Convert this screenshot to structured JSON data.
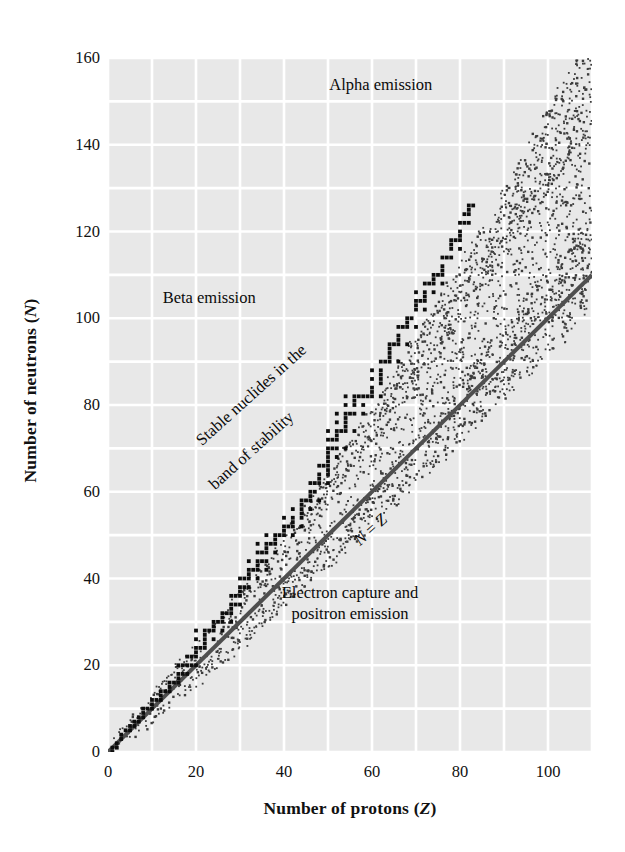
{
  "chart_data": {
    "type": "scatter",
    "title": "",
    "xlabel": "Number of protons (Z)",
    "ylabel": "Number of neutrons (N)",
    "xlim": [
      0,
      110
    ],
    "ylim": [
      0,
      160
    ],
    "grid": true,
    "grid_step_x": 10,
    "grid_step_y": 10,
    "xticks": [
      0,
      20,
      40,
      60,
      80,
      100
    ],
    "yticks": [
      0,
      20,
      40,
      60,
      80,
      100,
      120,
      140,
      160
    ],
    "legend": "none",
    "series": [
      {
        "name": "Stable nuclides (band of stability)",
        "marker": "filled-square",
        "color": "#0d0d0d",
        "description": "Dark band of stable nuclide points rising from (1,1) to about (83,126); N equals Z at low Z and curves to N/Z of about 1.5 at high Z.",
        "points": [
          [
            1,
            0
          ],
          [
            1,
            1
          ],
          [
            2,
            1
          ],
          [
            2,
            2
          ],
          [
            3,
            3
          ],
          [
            3,
            4
          ],
          [
            4,
            5
          ],
          [
            5,
            5
          ],
          [
            5,
            6
          ],
          [
            6,
            6
          ],
          [
            6,
            7
          ],
          [
            7,
            7
          ],
          [
            7,
            8
          ],
          [
            8,
            8
          ],
          [
            8,
            9
          ],
          [
            8,
            10
          ],
          [
            9,
            10
          ],
          [
            10,
            10
          ],
          [
            10,
            11
          ],
          [
            10,
            12
          ],
          [
            11,
            12
          ],
          [
            12,
            12
          ],
          [
            12,
            13
          ],
          [
            12,
            14
          ],
          [
            13,
            14
          ],
          [
            14,
            14
          ],
          [
            14,
            15
          ],
          [
            14,
            16
          ],
          [
            15,
            16
          ],
          [
            16,
            16
          ],
          [
            16,
            17
          ],
          [
            16,
            18
          ],
          [
            16,
            20
          ],
          [
            17,
            18
          ],
          [
            17,
            20
          ],
          [
            18,
            18
          ],
          [
            18,
            20
          ],
          [
            18,
            22
          ],
          [
            19,
            20
          ],
          [
            19,
            22
          ],
          [
            20,
            20
          ],
          [
            20,
            22
          ],
          [
            20,
            23
          ],
          [
            20,
            24
          ],
          [
            20,
            26
          ],
          [
            20,
            28
          ],
          [
            21,
            24
          ],
          [
            22,
            24
          ],
          [
            22,
            25
          ],
          [
            22,
            26
          ],
          [
            22,
            27
          ],
          [
            22,
            28
          ],
          [
            23,
            28
          ],
          [
            24,
            26
          ],
          [
            24,
            28
          ],
          [
            24,
            29
          ],
          [
            24,
            30
          ],
          [
            25,
            30
          ],
          [
            26,
            28
          ],
          [
            26,
            30
          ],
          [
            26,
            31
          ],
          [
            26,
            32
          ],
          [
            27,
            32
          ],
          [
            28,
            30
          ],
          [
            28,
            32
          ],
          [
            28,
            33
          ],
          [
            28,
            34
          ],
          [
            28,
            36
          ],
          [
            29,
            34
          ],
          [
            29,
            36
          ],
          [
            30,
            34
          ],
          [
            30,
            36
          ],
          [
            30,
            37
          ],
          [
            30,
            38
          ],
          [
            30,
            40
          ],
          [
            31,
            38
          ],
          [
            31,
            40
          ],
          [
            32,
            38
          ],
          [
            32,
            40
          ],
          [
            32,
            41
          ],
          [
            32,
            42
          ],
          [
            32,
            44
          ],
          [
            33,
            42
          ],
          [
            34,
            40
          ],
          [
            34,
            42
          ],
          [
            34,
            43
          ],
          [
            34,
            44
          ],
          [
            34,
            46
          ],
          [
            34,
            48
          ],
          [
            35,
            44
          ],
          [
            35,
            46
          ],
          [
            36,
            42
          ],
          [
            36,
            44
          ],
          [
            36,
            46
          ],
          [
            36,
            47
          ],
          [
            36,
            48
          ],
          [
            36,
            50
          ],
          [
            37,
            48
          ],
          [
            38,
            46
          ],
          [
            38,
            48
          ],
          [
            38,
            49
          ],
          [
            38,
            50
          ],
          [
            39,
            50
          ],
          [
            40,
            50
          ],
          [
            40,
            51
          ],
          [
            40,
            52
          ],
          [
            40,
            54
          ],
          [
            41,
            52
          ],
          [
            42,
            50
          ],
          [
            42,
            52
          ],
          [
            42,
            53
          ],
          [
            42,
            54
          ],
          [
            42,
            56
          ],
          [
            44,
            52
          ],
          [
            44,
            54
          ],
          [
            44,
            55
          ],
          [
            44,
            56
          ],
          [
            44,
            57
          ],
          [
            44,
            58
          ],
          [
            45,
            58
          ],
          [
            46,
            56
          ],
          [
            46,
            58
          ],
          [
            46,
            59
          ],
          [
            46,
            60
          ],
          [
            46,
            62
          ],
          [
            47,
            60
          ],
          [
            47,
            62
          ],
          [
            48,
            58
          ],
          [
            48,
            62
          ],
          [
            48,
            63
          ],
          [
            48,
            64
          ],
          [
            48,
            66
          ],
          [
            49,
            66
          ],
          [
            50,
            62
          ],
          [
            50,
            64
          ],
          [
            50,
            65
          ],
          [
            50,
            66
          ],
          [
            50,
            67
          ],
          [
            50,
            68
          ],
          [
            50,
            69
          ],
          [
            50,
            70
          ],
          [
            50,
            72
          ],
          [
            50,
            74
          ],
          [
            51,
            70
          ],
          [
            51,
            72
          ],
          [
            52,
            68
          ],
          [
            52,
            70
          ],
          [
            52,
            72
          ],
          [
            52,
            73
          ],
          [
            52,
            74
          ],
          [
            52,
            76
          ],
          [
            52,
            78
          ],
          [
            53,
            74
          ],
          [
            54,
            70
          ],
          [
            54,
            74
          ],
          [
            54,
            75
          ],
          [
            54,
            76
          ],
          [
            54,
            77
          ],
          [
            54,
            78
          ],
          [
            54,
            80
          ],
          [
            54,
            82
          ],
          [
            55,
            78
          ],
          [
            56,
            74
          ],
          [
            56,
            78
          ],
          [
            56,
            80
          ],
          [
            56,
            81
          ],
          [
            56,
            82
          ],
          [
            57,
            82
          ],
          [
            58,
            78
          ],
          [
            58,
            80
          ],
          [
            58,
            82
          ],
          [
            59,
            82
          ],
          [
            60,
            82
          ],
          [
            60,
            83
          ],
          [
            60,
            84
          ],
          [
            60,
            86
          ],
          [
            60,
            88
          ],
          [
            62,
            82
          ],
          [
            62,
            85
          ],
          [
            62,
            86
          ],
          [
            62,
            87
          ],
          [
            62,
            88
          ],
          [
            62,
            90
          ],
          [
            63,
            90
          ],
          [
            64,
            90
          ],
          [
            64,
            91
          ],
          [
            64,
            92
          ],
          [
            64,
            93
          ],
          [
            64,
            94
          ],
          [
            65,
            94
          ],
          [
            66,
            90
          ],
          [
            66,
            94
          ],
          [
            66,
            95
          ],
          [
            66,
            96
          ],
          [
            66,
            98
          ],
          [
            67,
            98
          ],
          [
            68,
            94
          ],
          [
            68,
            98
          ],
          [
            68,
            99
          ],
          [
            68,
            100
          ],
          [
            69,
            100
          ],
          [
            70,
            98
          ],
          [
            70,
            102
          ],
          [
            70,
            103
          ],
          [
            70,
            104
          ],
          [
            70,
            106
          ],
          [
            71,
            104
          ],
          [
            72,
            102
          ],
          [
            72,
            104
          ],
          [
            72,
            105
          ],
          [
            72,
            106
          ],
          [
            72,
            108
          ],
          [
            73,
            108
          ],
          [
            74,
            106
          ],
          [
            74,
            108
          ],
          [
            74,
            109
          ],
          [
            74,
            110
          ],
          [
            75,
            110
          ],
          [
            76,
            108
          ],
          [
            76,
            110
          ],
          [
            76,
            111
          ],
          [
            76,
            112
          ],
          [
            76,
            114
          ],
          [
            77,
            114
          ],
          [
            78,
            114
          ],
          [
            78,
            116
          ],
          [
            78,
            117
          ],
          [
            78,
            118
          ],
          [
            79,
            118
          ],
          [
            80,
            116
          ],
          [
            80,
            118
          ],
          [
            80,
            119
          ],
          [
            80,
            120
          ],
          [
            80,
            122
          ],
          [
            81,
            122
          ],
          [
            81,
            124
          ],
          [
            82,
            122
          ],
          [
            82,
            124
          ],
          [
            82,
            125
          ],
          [
            82,
            126
          ],
          [
            83,
            126
          ]
        ]
      },
      {
        "name": "Unstable nuclide band (stippled)",
        "marker": "small-dot",
        "color": "#3c3c3c",
        "description": "Dotted stipple halo surrounding the band of stability, widening with increasing Z and extending to roughly (110,157)."
      }
    ],
    "reference_lines": [
      {
        "name": "N = Z",
        "label": "N = Z",
        "color": "#4f4f4f",
        "width": 4,
        "from": [
          0,
          0
        ],
        "to": [
          110,
          110
        ]
      }
    ],
    "annotations": [
      {
        "id": "alpha",
        "text": "Alpha emission",
        "x": 62,
        "y": 154,
        "rotation": 0
      },
      {
        "id": "beta",
        "text": "Beta emission",
        "x": 23,
        "y": 105,
        "rotation": 0
      },
      {
        "id": "stable-1",
        "text": "Stable nuclides in the",
        "x": 19,
        "y": 73,
        "rotation": -42
      },
      {
        "id": "stable-2",
        "text": "band of stability",
        "x": 22,
        "y": 63,
        "rotation": -42
      },
      {
        "id": "nz",
        "text": "N = Z",
        "x": 55,
        "y": 50,
        "rotation": -42
      },
      {
        "id": "ec-1",
        "text": "Electron capture and",
        "x": 55,
        "y": 37,
        "rotation": 0
      },
      {
        "id": "ec-2",
        "text": "positron emission",
        "x": 55,
        "y": 32,
        "rotation": 0
      }
    ],
    "colors": {
      "panel_background": "#e8e8e8",
      "gridline": "#ffffff",
      "stable_points": "#0d0d0d",
      "stipple": "#3c3c3c",
      "nz_line": "#4f4f4f",
      "text": "#111111",
      "figure_background": "#ffffff"
    }
  },
  "axes": {
    "x": {
      "title_plain": "Number of protons (",
      "title_italic": "Z",
      "title_close": ")",
      "ticks": [
        "0",
        "20",
        "40",
        "60",
        "80",
        "100"
      ]
    },
    "y": {
      "title_plain": "Number of neutrons (",
      "title_italic": "N",
      "title_close": ")",
      "ticks": [
        "160",
        "140",
        "120",
        "100",
        "80",
        "60",
        "40",
        "20",
        "0"
      ]
    }
  },
  "labels": {
    "alpha_emission": "Alpha emission",
    "beta_emission": "Beta emission",
    "stable_line1": "Stable nuclides in the",
    "stable_line2": "band of stability",
    "nz_italic_n": "N",
    "nz_equals": " = ",
    "nz_italic_z": "Z",
    "electron_capture_line1": "Electron capture and",
    "electron_capture_line2": "positron emission"
  }
}
